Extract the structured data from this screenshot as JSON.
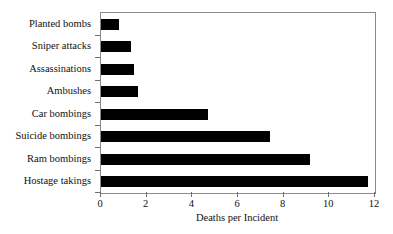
{
  "chart_data": {
    "type": "bar",
    "orientation": "horizontal",
    "title": "",
    "xlabel": "Deaths per Incident",
    "ylabel": "",
    "xlim": [
      0,
      12
    ],
    "xticks": [
      0,
      2,
      4,
      6,
      8,
      10,
      12
    ],
    "xtick_labels": [
      "0",
      "2",
      "4",
      "6",
      "8",
      "10",
      "12"
    ],
    "grid": false,
    "legend": false,
    "bar_color": "#000000",
    "frame_color": "#8a8a8a",
    "background_color": "#ffffff",
    "categories": [
      "Planted bombs",
      "Sniper attacks",
      "Assassinations",
      "Ambushes",
      "Car bombings",
      "Suicide bombings",
      "Ram bombings",
      "Hostage takings"
    ],
    "values": [
      0.8,
      1.3,
      1.45,
      1.6,
      4.7,
      7.4,
      9.15,
      11.7
    ]
  }
}
